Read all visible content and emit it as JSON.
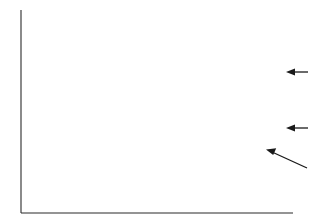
{
  "figure": {
    "background_color": "#ffffff",
    "line_color": "#1a1a1a",
    "axis_color": "#2b2b2b"
  },
  "annotations": {
    "a": {
      "label": "a",
      "arrow": "left-arrow-icon",
      "points_to": "trace-a"
    },
    "b": {
      "label": "b",
      "arrow": "left-arrow-icon",
      "points_to": "trace-b"
    },
    "c": {
      "label": "c",
      "arrow": "diagonal-arrow-icon",
      "points_to": "trace-c"
    }
  },
  "chart_data": {
    "type": "line",
    "title": "",
    "xlabel": "",
    "ylabel": "",
    "grid": false,
    "legend": "inline-right-arrow-labels",
    "xlim": [
      0,
      100
    ],
    "ylim": [
      0,
      100
    ],
    "axis": {
      "style": "L-frame",
      "x_axis_visible": true,
      "y_axis_visible": true,
      "ticks": false,
      "tick_labels": false
    },
    "series": [
      {
        "name": "a",
        "label": "a",
        "offset_band": "top",
        "x": [
          0.8,
          2.0,
          3.2,
          4.4,
          5.6,
          6.8,
          8.0,
          9.2,
          10.4,
          11.6,
          12.8,
          14.0,
          15.2,
          16.4,
          17.6,
          18.8,
          20.0,
          21.2,
          22.4,
          23.6,
          24.8,
          26.0,
          27.2,
          28.4,
          29.6,
          30.8,
          32.0,
          33.2,
          34.4,
          35.6,
          36.8,
          38.0,
          39.2,
          40.4,
          41.6,
          42.8,
          44.0,
          45.2,
          46.4,
          47.6,
          48.8,
          50.0,
          51.2,
          52.4,
          53.6,
          54.8,
          56.0,
          57.2,
          58.4,
          59.6,
          60.8,
          62.0,
          63.2,
          64.4,
          65.6,
          66.8,
          68.0,
          69.2,
          70.4,
          71.6,
          72.8,
          74.0,
          75.2,
          76.4,
          77.6,
          78.8,
          80.0,
          81.2,
          82.4,
          83.6,
          84.8,
          86.0,
          87.2,
          88.4,
          89.6,
          90.8,
          92.0,
          93.2,
          94.4,
          95.6,
          96.8,
          98.0,
          99.2
        ],
        "values": [
          80.5,
          86.0,
          91.5,
          94.0,
          92.0,
          86.0,
          80.0,
          76.0,
          74.5,
          76.0,
          79.5,
          83.0,
          83.5,
          81.0,
          77.0,
          74.0,
          72.5,
          73.0,
          75.0,
          78.5,
          81.0,
          82.0,
          81.5,
          79.0,
          75.0,
          71.0,
          68.5,
          69.5,
          73.0,
          78.0,
          81.0,
          81.5,
          79.5,
          77.5,
          77.0,
          78.5,
          81.0,
          82.5,
          81.0,
          77.0,
          72.5,
          70.0,
          71.0,
          75.5,
          82.0,
          88.0,
          92.5,
          94.5,
          92.0,
          86.0,
          80.0,
          76.0,
          75.5,
          79.0,
          83.0,
          84.5,
          82.5,
          78.0,
          73.0,
          70.0,
          70.5,
          74.0,
          79.0,
          83.5,
          86.0,
          85.0,
          81.0,
          76.5,
          73.5,
          73.0,
          75.5,
          79.0,
          82.5,
          86.5,
          89.5,
          90.0,
          87.0,
          82.0,
          77.0,
          74.0,
          73.5,
          77.0,
          92.0
        ]
      },
      {
        "name": "b",
        "label": "b",
        "offset_band": "middle",
        "x": [
          0.8,
          2.0,
          3.2,
          4.4,
          5.6,
          6.8,
          8.0,
          9.2,
          10.4,
          11.6,
          12.8,
          14.0,
          15.2,
          16.4,
          17.6,
          18.8,
          20.0,
          21.2,
          22.4,
          23.6,
          24.8,
          26.0,
          27.2,
          28.4,
          29.6,
          30.8,
          32.0,
          33.2,
          34.4,
          35.6,
          36.8,
          38.0,
          39.2,
          40.4,
          41.6,
          42.8,
          44.0,
          45.2,
          46.4,
          47.6,
          48.8,
          50.0,
          51.2,
          52.4,
          53.6,
          54.8,
          56.0,
          57.2,
          58.4,
          59.6,
          60.8,
          62.0,
          63.2,
          64.4,
          65.6,
          66.8,
          68.0,
          69.2,
          70.4,
          71.6,
          72.8,
          74.0,
          75.2,
          76.4,
          77.6,
          78.8,
          80.0,
          81.2,
          82.4,
          83.6,
          84.8,
          86.0,
          87.2,
          88.4,
          89.6,
          90.8,
          92.0,
          93.2,
          94.4,
          95.6,
          96.8,
          98.0,
          99.2
        ],
        "values": [
          40.0,
          43.0,
          45.0,
          43.5,
          40.0,
          36.5,
          35.0,
          37.0,
          41.0,
          44.5,
          46.0,
          45.5,
          44.5,
          44.5,
          45.0,
          44.5,
          43.0,
          41.0,
          40.0,
          43.0,
          49.0,
          55.0,
          57.0,
          53.0,
          46.0,
          41.0,
          40.0,
          43.0,
          48.0,
          54.0,
          57.5,
          56.0,
          51.0,
          46.0,
          43.5,
          44.0,
          46.5,
          48.0,
          47.0,
          44.0,
          41.5,
          41.0,
          42.5,
          44.0,
          44.0,
          43.0,
          43.5,
          46.0,
          50.0,
          54.0,
          56.0,
          55.0,
          52.0,
          50.0,
          50.5,
          53.0,
          56.0,
          58.5,
          60.0,
          62.0,
          64.0,
          64.5,
          62.0,
          57.0,
          52.0,
          48.5,
          47.5,
          49.0,
          51.0,
          51.5,
          49.5,
          46.5,
          44.5,
          44.0,
          45.5,
          47.5,
          48.0,
          46.0,
          43.0,
          41.5,
          43.5,
          46.5,
          44.0
        ]
      },
      {
        "name": "c",
        "label": "c",
        "offset_band": "bottom",
        "x": [
          0.8,
          2.0,
          3.2,
          4.4,
          5.6,
          6.8,
          8.0,
          9.2,
          10.4,
          11.6,
          12.8,
          14.0,
          15.2,
          16.4,
          17.6,
          18.8,
          20.0,
          21.2,
          22.4,
          23.6,
          24.8,
          26.0,
          27.2,
          28.4,
          29.6,
          30.8,
          32.0,
          33.2,
          34.4,
          35.6,
          36.8,
          38.0,
          39.2,
          40.4,
          41.6,
          42.8,
          44.0,
          45.2,
          46.4,
          47.6,
          48.8,
          50.0,
          51.2,
          52.4,
          53.6,
          54.8,
          56.0,
          57.2,
          58.4,
          59.6,
          60.8,
          62.0,
          63.2,
          64.4,
          65.6,
          66.8,
          68.0,
          69.2,
          70.4,
          71.6,
          72.8,
          74.0,
          75.2,
          76.4,
          77.6,
          78.8,
          80.0,
          81.2,
          82.4,
          83.6,
          84.8,
          86.0,
          87.2,
          88.4,
          89.6,
          90.8,
          92.0,
          93.2,
          94.4,
          95.6,
          96.8,
          98.0,
          99.2
        ],
        "values": [
          27.0,
          30.0,
          32.0,
          30.0,
          26.5,
          25.0,
          27.0,
          30.5,
          31.0,
          27.5,
          20.0,
          13.0,
          9.0,
          12.0,
          18.0,
          23.0,
          25.0,
          23.5,
          21.0,
          20.0,
          22.0,
          25.0,
          27.0,
          30.0,
          33.5,
          35.0,
          33.0,
          28.5,
          24.0,
          21.0,
          20.5,
          22.0,
          24.0,
          24.5,
          22.5,
          19.5,
          17.0,
          16.0,
          17.5,
          20.0,
          21.0,
          20.0,
          18.0,
          16.0,
          15.5,
          17.0,
          20.5,
          25.0,
          29.0,
          31.5,
          31.0,
          27.5,
          23.0,
          20.0,
          21.0,
          25.0,
          29.5,
          32.0,
          30.0,
          25.0,
          20.0,
          17.5,
          18.5,
          21.0,
          22.0,
          20.0,
          16.5,
          14.0,
          14.5,
          17.0,
          19.0,
          18.0,
          14.5,
          10.0,
          7.0,
          9.0,
          16.0,
          26.0,
          33.0,
          36.0,
          34.0,
          31.0,
          33.0
        ]
      }
    ]
  }
}
